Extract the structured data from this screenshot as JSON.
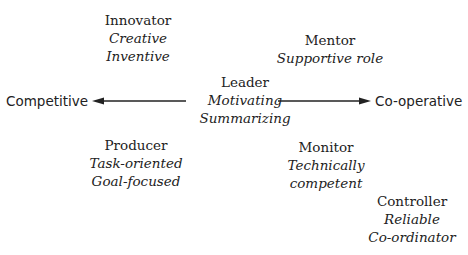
{
  "diagram": {
    "type": "role-map",
    "axis": {
      "left_label": "Competitive",
      "right_label": "Co-operative"
    },
    "roles": [
      {
        "title": "Innovator",
        "traits": [
          "Creative",
          "Inventive"
        ]
      },
      {
        "title": "Mentor",
        "traits": [
          "Supportive role"
        ]
      },
      {
        "title": "Leader",
        "traits": [
          "Motivating",
          "Summarizing"
        ]
      },
      {
        "title": "Producer",
        "traits": [
          "Task-oriented",
          "Goal-focused"
        ]
      },
      {
        "title": "Monitor",
        "traits": [
          "Technically",
          "competent"
        ]
      },
      {
        "title": "Controller",
        "traits": [
          "Reliable",
          "Co-ordinator"
        ]
      }
    ],
    "colors": {
      "text": "#222222",
      "arrow": "#222222",
      "background": "#ffffff"
    }
  }
}
